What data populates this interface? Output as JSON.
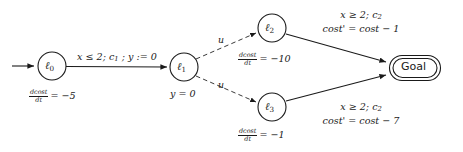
{
  "diagram": {
    "type": "hybrid-automaton-state-diagram",
    "title": "",
    "colors": {
      "stroke": "#1a1a1a",
      "dashed_stroke": "#3a3a3a",
      "background": "#ffffff"
    },
    "nodes": [
      {
        "id": "l0",
        "label": "ℓ",
        "subscript": "0",
        "shape": "circle",
        "accepting": false,
        "initial": true,
        "cx": 52,
        "cy": 66,
        "r": 14,
        "annotation": {
          "kind": "flow",
          "numerator": "dcost",
          "denominator": "dt",
          "relation": "=",
          "value": "−5",
          "text": "dcost/dt = −5"
        }
      },
      {
        "id": "l1",
        "label": "ℓ",
        "subscript": "1",
        "shape": "circle",
        "accepting": false,
        "initial": false,
        "cx": 184,
        "cy": 67,
        "r": 14,
        "annotation": {
          "kind": "invariant",
          "text": "y = 0"
        }
      },
      {
        "id": "l2",
        "label": "ℓ",
        "subscript": "2",
        "shape": "circle",
        "accepting": false,
        "initial": false,
        "cx": 272,
        "cy": 28,
        "r": 14,
        "annotation": {
          "kind": "flow",
          "numerator": "dcost",
          "denominator": "dt",
          "relation": "=",
          "value": "−10",
          "text": "dcost/dt = −10"
        }
      },
      {
        "id": "l3",
        "label": "ℓ",
        "subscript": "3",
        "shape": "circle",
        "accepting": false,
        "initial": false,
        "cx": 272,
        "cy": 107,
        "r": 14,
        "annotation": {
          "kind": "flow",
          "numerator": "dcost",
          "denominator": "dt",
          "relation": "=",
          "value": "−1",
          "text": "dcost/dt = −1"
        }
      },
      {
        "id": "goal",
        "label": "Goal",
        "subscript": "",
        "shape": "rounded-rectangle-double",
        "accepting": true,
        "initial": false,
        "cx": 415,
        "cy": 68,
        "r": 0,
        "annotation": null
      }
    ],
    "edges": [
      {
        "id": "init-l0",
        "from": "",
        "to": "l0",
        "style": "solid",
        "label": ""
      },
      {
        "id": "l0-l1",
        "from": "l0",
        "to": "l1",
        "style": "solid",
        "label_lines": [
          "x ≤ 2; c1 ; y := 0"
        ],
        "guard": "x ≤ 2",
        "event": "c1",
        "update": "y := 0"
      },
      {
        "id": "l1-l2",
        "from": "l1",
        "to": "l2",
        "style": "dashed",
        "label_lines": [
          "u"
        ],
        "guard": "",
        "event": "u",
        "update": ""
      },
      {
        "id": "l1-l3",
        "from": "l1",
        "to": "l3",
        "style": "dashed",
        "label_lines": [
          "u"
        ],
        "guard": "",
        "event": "u",
        "update": ""
      },
      {
        "id": "l2-goal",
        "from": "l2",
        "to": "goal",
        "style": "solid",
        "label_lines": [
          "x ≥ 2; c2",
          "cost' = cost − 1"
        ],
        "guard": "x ≥ 2",
        "event": "c2",
        "update": "cost' = cost − 1"
      },
      {
        "id": "l3-goal",
        "from": "l3",
        "to": "goal",
        "style": "solid",
        "label_lines": [
          "x ≥ 2; c2",
          "cost' = cost − 7"
        ],
        "guard": "x ≥ 2",
        "event": "c2",
        "update": "cost' = cost − 7"
      }
    ],
    "text": {
      "node_l0_base": "ℓ",
      "node_l0_sub": "0",
      "node_l1_base": "ℓ",
      "node_l1_sub": "1",
      "node_l2_base": "ℓ",
      "node_l2_sub": "2",
      "node_l3_base": "ℓ",
      "node_l3_sub": "3",
      "goal_label": "Goal",
      "l1_invariant": "y = 0",
      "flow_numerator": "dcost",
      "flow_denominator": "dt",
      "l0_flow_rhs": "= −5",
      "l2_flow_rhs": "= −10",
      "l3_flow_rhs": "= −1",
      "edge_l0_l1_guard": "x ≤ 2",
      "edge_l0_l1_sep1": "; ",
      "edge_l0_l1_event_base": "c",
      "edge_l0_l1_event_sub": "1",
      "edge_l0_l1_sep2": " ; ",
      "edge_l0_l1_update": "y := 0",
      "edge_u_upper": "u",
      "edge_u_lower": "u",
      "edge_goal_guard": "x ≥ 2",
      "edge_goal_sep": "; ",
      "edge_goal_event_base": "c",
      "edge_goal_event_sub": "2",
      "edge_l2_goal_update": "cost' = cost − 1",
      "edge_l3_goal_update": "cost' = cost − 7"
    }
  }
}
